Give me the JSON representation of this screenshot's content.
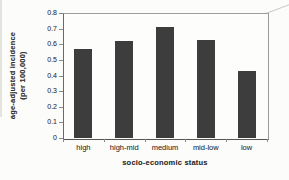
{
  "chart_data": {
    "type": "bar",
    "title": "",
    "categories": [
      "high",
      "high-mid",
      "medium",
      "mid-low",
      "low"
    ],
    "values": [
      0.57,
      0.62,
      0.71,
      0.63,
      0.43
    ],
    "xlabel": "socio-economic status",
    "ylabel": "age-adjusted incidence (per 100,000)",
    "ylabel_line1": "age-adjusted incidence",
    "ylabel_line2": "(per 100,000)",
    "ylim": [
      0,
      0.8
    ],
    "yticks": [
      "0.8",
      "0.7",
      "0.6",
      "0.5",
      "0.4",
      "0.3",
      "0.2",
      "0.1",
      "0"
    ],
    "grid": false,
    "legend": "none",
    "bar_color": "#3d3d3d"
  },
  "colors": {
    "bar": "#3d3d3d",
    "axis_line": "#555555",
    "box_border": "#9a9a96",
    "tick": "#8a8a8a",
    "text": "#3a3a3a",
    "background": "#fcfcfa"
  },
  "notes": {
    "style": "scanned grayscale bar chart"
  }
}
